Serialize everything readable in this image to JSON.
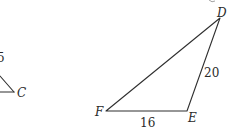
{
  "figure": {
    "left_triangle": {
      "side_label": "5",
      "vertex_label": "C"
    },
    "right_triangle": {
      "vertices": {
        "D": {
          "label": "D"
        },
        "E": {
          "label": "E"
        },
        "F": {
          "label": "F"
        }
      },
      "sides": {
        "FE": "16",
        "ED": "20"
      }
    },
    "colors": {
      "line": "#2f2f2f",
      "text": "#2a2a2a",
      "background": "#ffffff"
    }
  }
}
